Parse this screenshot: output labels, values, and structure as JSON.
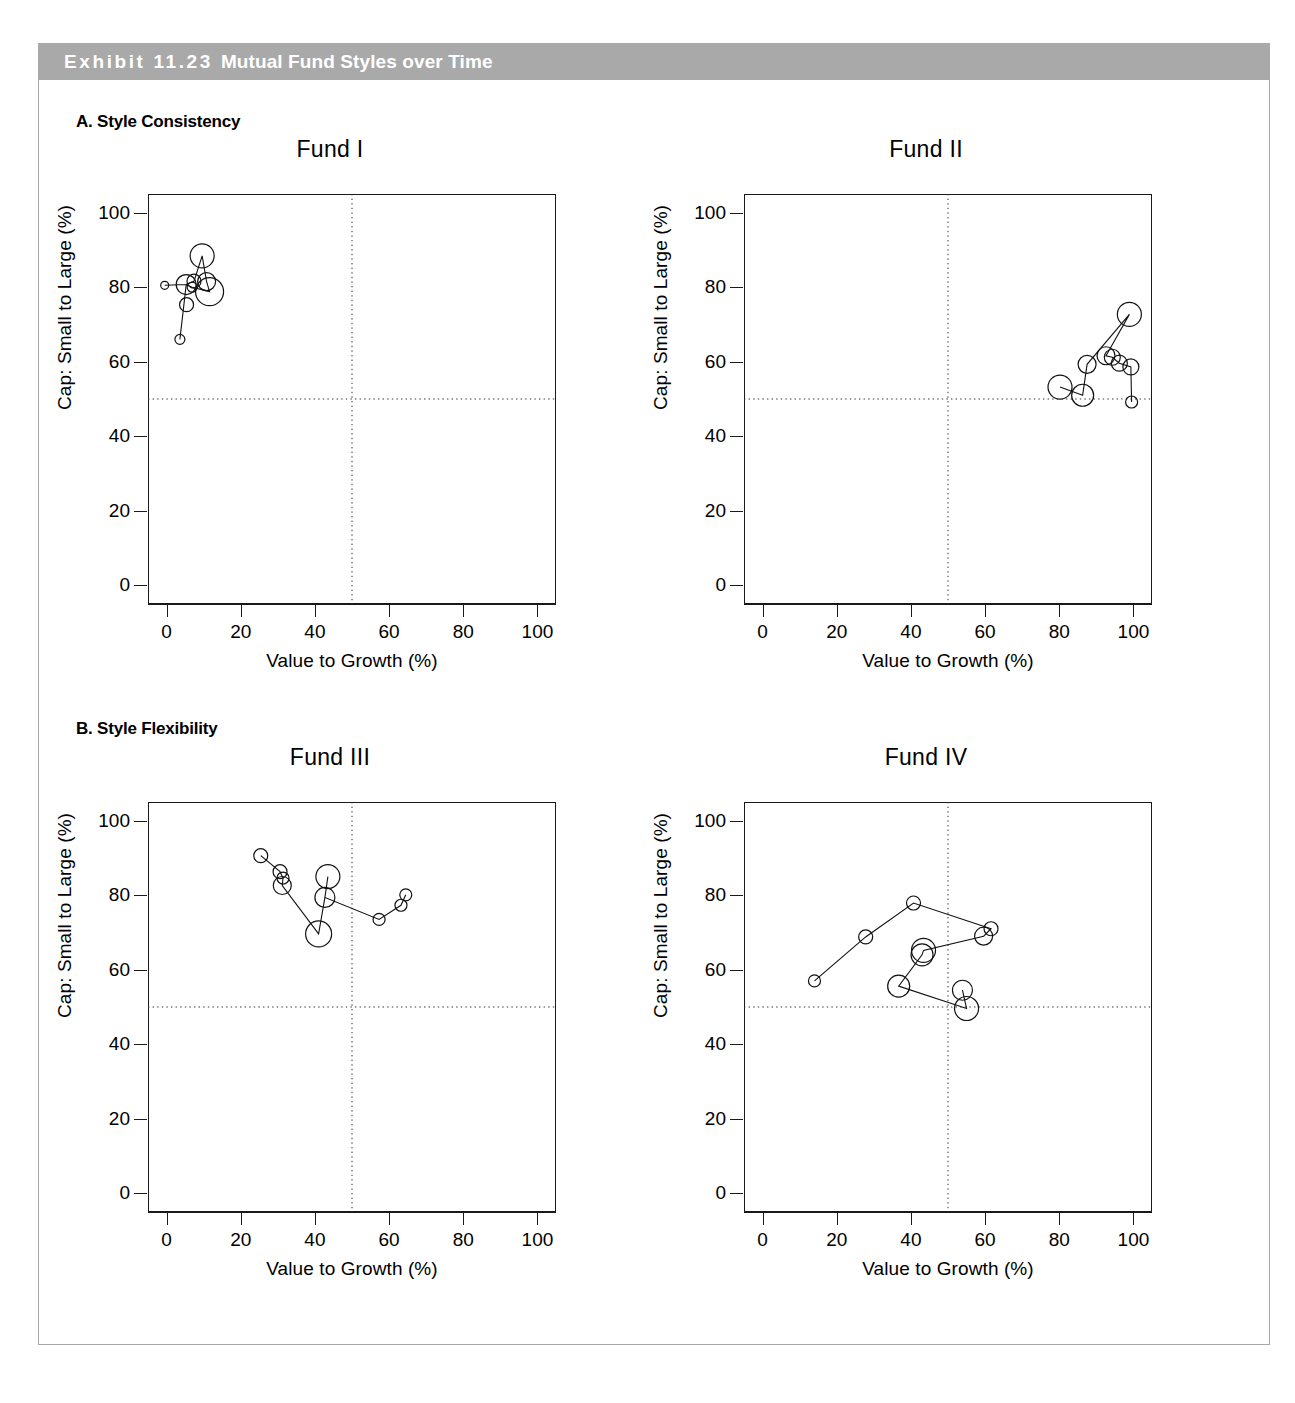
{
  "exhibit": {
    "number_label": "Exhibit 11.23",
    "title": "Mutual Fund Styles over Time",
    "header_bg": "#a9a9a9",
    "header_fg": "#ffffff"
  },
  "sections": [
    {
      "id": "a",
      "label": "A. Style Consistency"
    },
    {
      "id": "b",
      "label": "B. Style Flexibility"
    }
  ],
  "axes": {
    "x_title": "Value to Growth (%)",
    "y_title": "Cap: Small to Large (%)",
    "x_ticks": [
      "0",
      "20",
      "40",
      "60",
      "80",
      "100"
    ],
    "y_ticks": [
      "0",
      "20",
      "40",
      "60",
      "80",
      "100"
    ],
    "x_tick_values": [
      0,
      20,
      40,
      60,
      80,
      100
    ],
    "y_tick_values": [
      0,
      20,
      40,
      60,
      80,
      100
    ],
    "xlim": [
      -5,
      105
    ],
    "ylim": [
      -5,
      105
    ],
    "reference_lines": {
      "x": 50,
      "y": 50,
      "style": "dotted"
    }
  },
  "chart_data": [
    {
      "type": "scatter",
      "id": "fund-1",
      "title": "Fund I",
      "section": "A. Style Consistency",
      "xlabel": "Value to Growth (%)",
      "ylabel": "Cap: Small to Large (%)",
      "xlim": [
        -5,
        105
      ],
      "ylim": [
        -5,
        105
      ],
      "grid": false,
      "legend": "none",
      "connected": true,
      "note": "Points connected in time order; marker size encodes relative weight",
      "points": [
        {
          "x": -0.5,
          "y": 80.5,
          "size": 4
        },
        {
          "x": 5.3,
          "y": 80.7,
          "size": 10
        },
        {
          "x": 7.4,
          "y": 81.6,
          "size": 7
        },
        {
          "x": 9.6,
          "y": 88.4,
          "size": 12
        },
        {
          "x": 10.8,
          "y": 81.5,
          "size": 9
        },
        {
          "x": 11.6,
          "y": 78.8,
          "size": 14
        },
        {
          "x": 6.9,
          "y": 80.0,
          "size": 5
        },
        {
          "x": 5.4,
          "y": 75.3,
          "size": 7
        },
        {
          "x": 3.6,
          "y": 66.0,
          "size": 5
        }
      ],
      "path_order": [
        0,
        1,
        2,
        3,
        4,
        5,
        6,
        1,
        8
      ]
    },
    {
      "type": "scatter",
      "id": "fund-2",
      "title": "Fund II",
      "section": "A. Style Consistency",
      "xlabel": "Value to Growth (%)",
      "ylabel": "Cap: Small to Large (%)",
      "xlim": [
        -5,
        105
      ],
      "ylim": [
        -5,
        105
      ],
      "grid": false,
      "legend": "none",
      "connected": true,
      "points": [
        {
          "x": 80.2,
          "y": 53.2,
          "size": 12
        },
        {
          "x": 86.3,
          "y": 51.0,
          "size": 11
        },
        {
          "x": 87.5,
          "y": 59.3,
          "size": 9
        },
        {
          "x": 92.6,
          "y": 61.6,
          "size": 9
        },
        {
          "x": 94.3,
          "y": 61.2,
          "size": 8
        },
        {
          "x": 96.2,
          "y": 59.6,
          "size": 8
        },
        {
          "x": 98.9,
          "y": 72.7,
          "size": 12
        },
        {
          "x": 99.3,
          "y": 58.6,
          "size": 8
        },
        {
          "x": 99.5,
          "y": 49.2,
          "size": 6
        }
      ],
      "path_order": [
        0,
        1,
        2,
        6,
        3,
        4,
        5,
        7,
        8
      ]
    },
    {
      "type": "scatter",
      "id": "fund-3",
      "title": "Fund III",
      "section": "B. Style Flexibility",
      "xlabel": "Value to Growth (%)",
      "ylabel": "Cap: Small to Large (%)",
      "xlim": [
        -5,
        105
      ],
      "ylim": [
        -5,
        105
      ],
      "grid": false,
      "legend": "none",
      "connected": true,
      "points": [
        {
          "x": 25.4,
          "y": 90.6,
          "size": 7
        },
        {
          "x": 30.6,
          "y": 86.3,
          "size": 7
        },
        {
          "x": 31.4,
          "y": 84.6,
          "size": 6
        },
        {
          "x": 31.2,
          "y": 82.6,
          "size": 9
        },
        {
          "x": 41.0,
          "y": 69.6,
          "size": 13
        },
        {
          "x": 43.5,
          "y": 85.0,
          "size": 12
        },
        {
          "x": 42.7,
          "y": 79.4,
          "size": 10
        },
        {
          "x": 57.3,
          "y": 73.5,
          "size": 6
        },
        {
          "x": 63.2,
          "y": 77.3,
          "size": 6
        },
        {
          "x": 64.5,
          "y": 80.1,
          "size": 6
        }
      ],
      "path_order": [
        0,
        1,
        2,
        3,
        4,
        6,
        5,
        6,
        7,
        8,
        9
      ]
    },
    {
      "type": "scatter",
      "id": "fund-4",
      "title": "Fund IV",
      "section": "B. Style Flexibility",
      "xlabel": "Value to Growth (%)",
      "ylabel": "Cap: Small to Large (%)",
      "xlim": [
        -5,
        105
      ],
      "ylim": [
        -5,
        105
      ],
      "grid": false,
      "legend": "none",
      "connected": true,
      "points": [
        {
          "x": 14.0,
          "y": 57.0,
          "size": 6
        },
        {
          "x": 27.8,
          "y": 68.8,
          "size": 7
        },
        {
          "x": 40.7,
          "y": 77.9,
          "size": 7
        },
        {
          "x": 61.6,
          "y": 71.0,
          "size": 7
        },
        {
          "x": 59.6,
          "y": 69.0,
          "size": 9
        },
        {
          "x": 43.4,
          "y": 65.2,
          "size": 12
        },
        {
          "x": 43.0,
          "y": 64.0,
          "size": 11
        },
        {
          "x": 36.7,
          "y": 55.6,
          "size": 11
        },
        {
          "x": 55.0,
          "y": 49.6,
          "size": 12
        },
        {
          "x": 53.9,
          "y": 54.5,
          "size": 10
        }
      ],
      "path_order": [
        0,
        1,
        2,
        3,
        4,
        5,
        6,
        7,
        8,
        9
      ]
    }
  ]
}
